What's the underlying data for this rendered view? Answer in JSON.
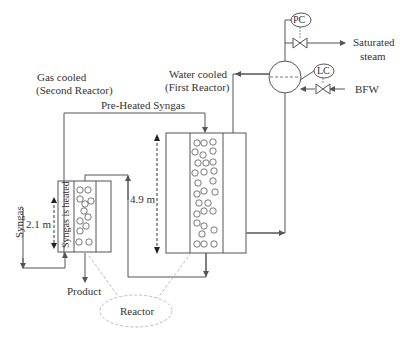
{
  "diagram": {
    "labels": {
      "gas_cooled_line1": "Gas cooled",
      "gas_cooled_line2": "(Second Reactor)",
      "water_cooled_line1": "Water cooled",
      "water_cooled_line2": "(First Reactor)",
      "preheated_syngas": "Pre-Heated Syngas",
      "syngas": "Syngas",
      "syngas_is_heated": "Syngas is heated",
      "height_second": "2.1 m",
      "height_first": "4.9 m",
      "product": "Product",
      "reactor": "Reactor",
      "pc": "PC",
      "lc": "LC",
      "saturated_steam_line1": "Saturated",
      "saturated_steam_line2": "steam",
      "bfw": "BFW"
    },
    "colors": {
      "line": "#555555",
      "dashed": "#aaaaaa",
      "text": "#333333"
    }
  }
}
